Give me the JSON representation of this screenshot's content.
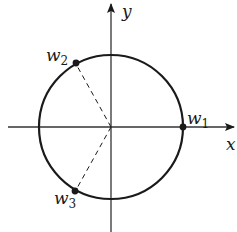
{
  "diagram": {
    "title": "",
    "axes": {
      "x_label": "x",
      "y_label": "y"
    },
    "circle": {
      "description": "unit circle centered at origin"
    },
    "points": [
      {
        "name": "w1",
        "base": "w",
        "subscript": "1",
        "angle_deg": 0
      },
      {
        "name": "w2",
        "base": "w",
        "subscript": "2",
        "angle_deg": 120
      },
      {
        "name": "w3",
        "base": "w",
        "subscript": "3",
        "angle_deg": 240
      }
    ],
    "dashed_segments": [
      {
        "from": "origin",
        "to": "w2"
      },
      {
        "from": "origin",
        "to": "w3"
      }
    ],
    "colors": {
      "stroke": "#1a1a1a",
      "background": "#ffffff"
    }
  }
}
